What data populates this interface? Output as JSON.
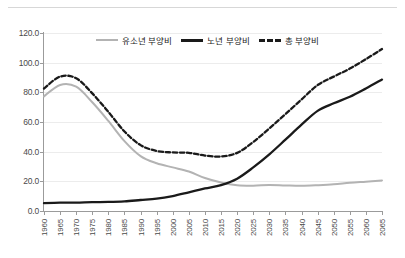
{
  "top_strip_text": "",
  "legend": {
    "position": "top-center",
    "items": [
      {
        "label": "유소년 부양비",
        "key": "youth",
        "style": "solid",
        "color": "#b3b3b3"
      },
      {
        "label": "노년 부양비",
        "key": "old",
        "style": "solid",
        "color": "#1a1a1a"
      },
      {
        "label": "총 부양비",
        "key": "total",
        "style": "dashed",
        "color": "#1a1a1a"
      }
    ]
  },
  "chart_data": {
    "type": "line",
    "title": "",
    "xlabel": "",
    "ylabel": "",
    "grid": true,
    "legend_position": "top-center",
    "xlim": [
      1960,
      2065
    ],
    "ylim": [
      0.0,
      120.0
    ],
    "ytick_labels": [
      "120.0",
      "100.0",
      "80.0",
      "60.0",
      "40.0",
      "20.0",
      "0.0"
    ],
    "yticks": [
      120.0,
      100.0,
      80.0,
      60.0,
      40.0,
      20.0,
      0.0
    ],
    "x": [
      1960,
      1965,
      1970,
      1975,
      1980,
      1985,
      1990,
      1995,
      2000,
      2005,
      2010,
      2015,
      2020,
      2025,
      2030,
      2035,
      2040,
      2045,
      2050,
      2055,
      2060,
      2065
    ],
    "xtick_labels": [
      "1960",
      "1965",
      "1970",
      "1975",
      "1980",
      "1985",
      "1990",
      "1995",
      "2000",
      "2005",
      "2010",
      "2015",
      "2020",
      "2025",
      "2030",
      "2035",
      "2040",
      "2045",
      "2050",
      "2055",
      "2060",
      "2065"
    ],
    "series": [
      {
        "name": "유소년 부양비",
        "key": "youth",
        "color": "#b3b3b3",
        "style": "solid",
        "values": [
          77.3,
          85.0,
          83.8,
          73.3,
          60.7,
          47.1,
          37.0,
          32.2,
          29.4,
          26.6,
          22.2,
          19.2,
          17.4,
          17.1,
          17.5,
          17.2,
          17.0,
          17.4,
          18.0,
          19.0,
          19.8,
          20.6
        ]
      },
      {
        "name": "노년 부양비",
        "key": "old",
        "color": "#1a1a1a",
        "style": "solid",
        "values": [
          5.3,
          5.6,
          5.7,
          6.0,
          6.1,
          6.5,
          7.4,
          8.3,
          10.1,
          12.6,
          15.2,
          17.5,
          21.8,
          29.4,
          38.2,
          48.1,
          58.2,
          67.5,
          72.6,
          77.0,
          82.6,
          88.6
        ]
      },
      {
        "name": "총 부양비",
        "key": "total",
        "color": "#1a1a1a",
        "style": "dashed",
        "values": [
          82.6,
          90.6,
          89.5,
          79.3,
          66.8,
          53.6,
          44.4,
          40.5,
          39.5,
          39.2,
          37.4,
          36.7,
          39.2,
          46.5,
          55.7,
          65.3,
          75.2,
          84.9,
          90.6,
          96.0,
          102.4,
          109.2
        ]
      }
    ]
  }
}
